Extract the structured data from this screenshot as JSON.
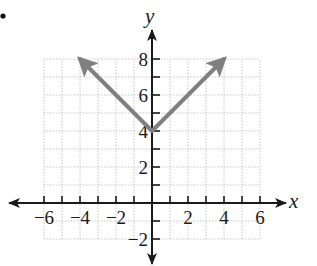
{
  "colors": {
    "background": "#ffffff",
    "axis": "#1a1a1a",
    "grid": "#c8c8c8",
    "series": "#808080"
  },
  "chart_data": {
    "type": "line",
    "title": "",
    "function": "y = |x| + 4",
    "xlabel": "x",
    "ylabel": "y",
    "xlim": [
      -6,
      6
    ],
    "ylim": [
      -2,
      8
    ],
    "grid": true,
    "grid_step": 1,
    "x_ticks": [
      -6,
      -5,
      -4,
      -3,
      -2,
      -1,
      1,
      2,
      3,
      4,
      5,
      6
    ],
    "x_tick_labels": [
      "-6",
      "-4",
      "-2",
      "2",
      "4",
      "6"
    ],
    "x_tick_label_values": [
      -6,
      -4,
      -2,
      2,
      4,
      6
    ],
    "y_ticks": [
      -2,
      -1,
      1,
      2,
      3,
      4,
      5,
      6,
      7,
      8
    ],
    "y_tick_labels": [
      "8",
      "6",
      "4",
      "2",
      "-2"
    ],
    "y_tick_label_values": [
      8,
      6,
      4,
      2,
      -2
    ],
    "series": [
      {
        "name": "left ray",
        "points": [
          [
            0,
            4
          ],
          [
            -4,
            8
          ]
        ],
        "arrow_end": true
      },
      {
        "name": "right ray",
        "points": [
          [
            0,
            4
          ],
          [
            4,
            8
          ]
        ],
        "arrow_end": true
      }
    ],
    "vertex": [
      0,
      4
    ],
    "legend": null
  },
  "bullet": "•"
}
